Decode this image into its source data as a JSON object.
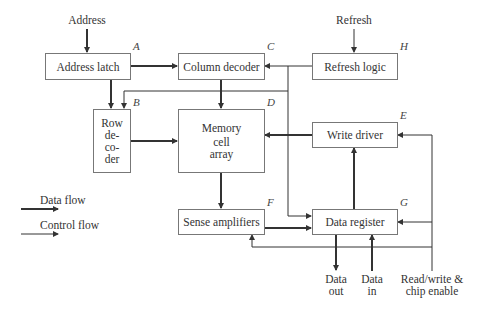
{
  "blocks": {
    "address_latch": {
      "label": "Address latch",
      "tag": "A"
    },
    "row_decoder": {
      "label_lines": [
        "Row",
        "de-",
        "co-",
        "der"
      ],
      "tag": "B"
    },
    "column_decoder": {
      "label": "Column decoder",
      "tag": "C"
    },
    "memory_cell_array": {
      "label_lines": [
        "Memory",
        "cell",
        "array"
      ],
      "tag": "D"
    },
    "write_driver": {
      "label": "Write driver",
      "tag": "E"
    },
    "sense_amplifiers": {
      "label": "Sense amplifiers",
      "tag": "F"
    },
    "data_register": {
      "label": "Data register",
      "tag": "G"
    },
    "refresh_logic": {
      "label": "Refresh logic",
      "tag": "H"
    }
  },
  "inputs": {
    "address": "Address",
    "refresh": "Refresh",
    "data_out_lines": [
      "Data",
      "out"
    ],
    "data_in_lines": [
      "Data",
      "in"
    ],
    "rw_lines": [
      "Read/write &",
      "chip enable"
    ]
  },
  "legend": {
    "data_flow": "Data flow",
    "control_flow": "Control flow"
  },
  "colors": {
    "line": "#333333",
    "box_border": "#777777"
  }
}
